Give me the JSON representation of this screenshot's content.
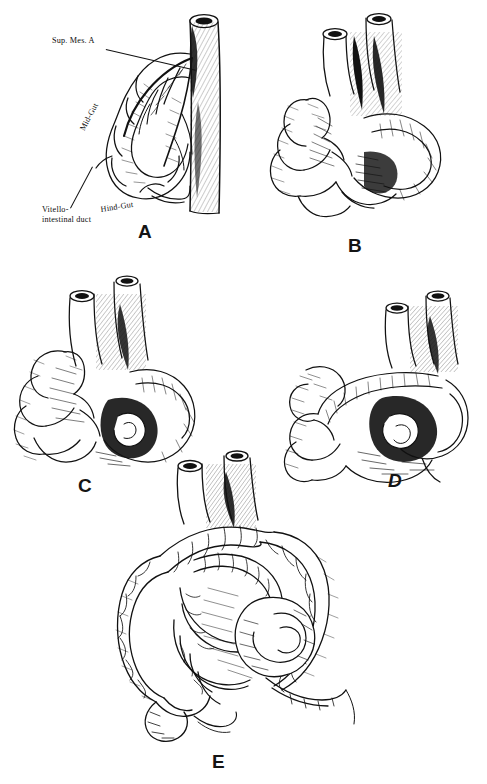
{
  "plate": {
    "title": "Stages of midgut rotation",
    "background_color": "#ffffff",
    "ink_color": "#111111"
  },
  "panels": [
    {
      "letter": "A",
      "caption": "A",
      "stage": "Early midgut loop with superior mesenteric artery axis",
      "x": 138,
      "y": 222
    },
    {
      "letter": "B",
      "caption": "B",
      "stage": "Initial counterclockwise rotation of the midgut loop",
      "x": 348,
      "y": 236
    },
    {
      "letter": "C",
      "caption": "C",
      "stage": "Further rotation with herniated small bowel loops",
      "x": 78,
      "y": 476
    },
    {
      "letter": "D",
      "caption": "D",
      "stage": "Return of midgut to abdominal cavity",
      "x": 388,
      "y": 471
    },
    {
      "letter": "E",
      "caption": "E",
      "stage": "Completed rotation and fixation of colon and small bowel",
      "x": 212,
      "y": 752
    }
  ],
  "annotations": [
    {
      "id": "sup-mes-a",
      "text": "Sup. Mes. A",
      "x": 52,
      "y": 42,
      "rotation": 0
    },
    {
      "id": "mid-gut",
      "text": "Mid-Gut",
      "x": 78,
      "y": 128,
      "rotation": -62
    },
    {
      "id": "hind-gut",
      "text": "Hind-Gut",
      "x": 100,
      "y": 207,
      "rotation": -9
    },
    {
      "id": "vitello-intestinal-duct-line1",
      "text": "Vitello-",
      "x": 42,
      "y": 212,
      "rotation": 0
    },
    {
      "id": "vitello-intestinal-duct-line2",
      "text": "intestinal duct",
      "x": 42,
      "y": 222,
      "rotation": 0
    }
  ],
  "leader_lines": [
    {
      "id": "leader-sup-mes-a",
      "x": 106,
      "y": 49,
      "length": 92,
      "angle": 13
    },
    {
      "id": "leader-vitello",
      "x": 70,
      "y": 210,
      "length": 47,
      "angle": -62
    }
  ]
}
